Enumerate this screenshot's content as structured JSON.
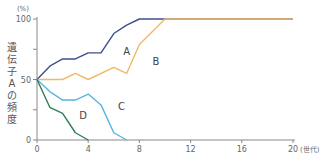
{
  "chart_data": {
    "type": "line",
    "title": "",
    "xlabel": "(世代)",
    "ylabel": "遺伝子Aの頻度",
    "yunit": "(%)",
    "xlim": [
      0,
      20
    ],
    "ylim": [
      0,
      100
    ],
    "xticks": [
      0,
      4,
      8,
      12,
      16,
      20
    ],
    "yticks_labeled": [
      0,
      50,
      100
    ],
    "yticks_minor": [
      25,
      75
    ],
    "grid": false,
    "legend": "inline labels",
    "series": [
      {
        "name": "A",
        "color": "#3d4f8c",
        "x": [
          0,
          1,
          2,
          3,
          4,
          5,
          6,
          7,
          8,
          20
        ],
        "values": [
          50,
          61,
          67,
          67,
          72,
          72,
          88,
          95,
          100,
          100
        ],
        "label_pos": [
          7.0,
          70
        ]
      },
      {
        "name": "B",
        "color": "#f2b866",
        "x": [
          0,
          2,
          3,
          4,
          6,
          7,
          8,
          10,
          20
        ],
        "values": [
          50,
          50,
          55,
          50,
          60,
          55,
          79,
          100,
          100
        ],
        "label_pos": [
          9.3,
          62
        ]
      },
      {
        "name": "C",
        "color": "#56b4e0",
        "x": [
          0,
          1,
          2,
          3,
          4,
          5,
          6,
          7
        ],
        "values": [
          50,
          40,
          33,
          33,
          38,
          29,
          6,
          0
        ],
        "label_pos": [
          6.6,
          25
        ]
      },
      {
        "name": "D",
        "color": "#2f7d55",
        "x": [
          0,
          1,
          2,
          3,
          4
        ],
        "values": [
          50,
          27,
          22,
          6,
          0
        ],
        "label_pos": [
          3.6,
          17
        ]
      }
    ]
  }
}
